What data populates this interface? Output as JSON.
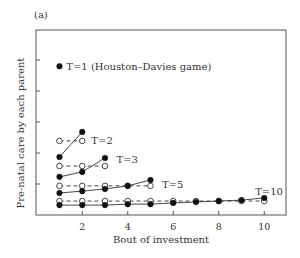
{
  "figure": {
    "panel_label": "(a)",
    "xlabel": "Bout of investment",
    "ylabel": "Pre-natal care by each parent"
  },
  "chart_data": {
    "type": "line",
    "title": "",
    "panel_label": "(a)",
    "xlabel": "Bout of investment",
    "ylabel": "Pre-natal care by each parent",
    "xlim": [
      0,
      11
    ],
    "ylim": [
      0,
      6
    ],
    "x_ticks": [
      2,
      4,
      6,
      8,
      10
    ],
    "y_ticks_unlabeled": [
      1,
      2,
      3,
      4,
      5
    ],
    "grid": false,
    "legend": "none (series annotated inline)",
    "marker_key": {
      "filled_circle_solid_line": "model prediction",
      "open_circle_dashed_line": "constant reference"
    },
    "series": [
      {
        "name": "T=1 (Houston–Davies game)",
        "style": "filled",
        "x": [
          1
        ],
        "y": [
          4.8
        ],
        "label_pos": {
          "x": 1.3,
          "y": 4.8
        }
      },
      {
        "name": "T=2",
        "style": "filled",
        "x": [
          1,
          2
        ],
        "y": [
          1.87,
          2.68
        ]
      },
      {
        "name": "T=2 (open)",
        "style": "open",
        "x": [
          1,
          2
        ],
        "y": [
          2.39,
          2.39
        ],
        "label": "T=2",
        "label_pos": {
          "x": 2.4,
          "y": 2.4
        }
      },
      {
        "name": "T=3",
        "style": "filled",
        "x": [
          1,
          2,
          3
        ],
        "y": [
          1.23,
          1.39,
          1.84
        ]
      },
      {
        "name": "T=3 (open)",
        "style": "open",
        "x": [
          1,
          2,
          3
        ],
        "y": [
          1.58,
          1.58,
          1.58
        ],
        "label": "T=3",
        "label_pos": {
          "x": 3.5,
          "y": 1.8
        }
      },
      {
        "name": "T=5",
        "style": "filled",
        "x": [
          1,
          2,
          3,
          4,
          5
        ],
        "y": [
          0.71,
          0.77,
          0.84,
          0.94,
          1.13
        ]
      },
      {
        "name": "T=5 (open)",
        "style": "open",
        "x": [
          1,
          2,
          3,
          4,
          5
        ],
        "y": [
          0.94,
          0.94,
          0.94,
          0.94,
          0.94
        ],
        "label": "T=5",
        "label_pos": {
          "x": 5.5,
          "y": 1.0
        }
      },
      {
        "name": "T=10",
        "style": "filled",
        "x": [
          1,
          2,
          3,
          4,
          5,
          6,
          7,
          8,
          9,
          10
        ],
        "y": [
          0.32,
          0.32,
          0.32,
          0.35,
          0.35,
          0.39,
          0.42,
          0.45,
          0.48,
          0.55
        ]
      },
      {
        "name": "T=10 (open)",
        "style": "open",
        "x": [
          1,
          2,
          3,
          4,
          5,
          6,
          7,
          8,
          9,
          10
        ],
        "y": [
          0.45,
          0.45,
          0.45,
          0.45,
          0.45,
          0.45,
          0.45,
          0.45,
          0.45,
          0.45
        ],
        "label": "T=10",
        "label_pos": {
          "x": 9.6,
          "y": 0.75
        }
      }
    ]
  }
}
